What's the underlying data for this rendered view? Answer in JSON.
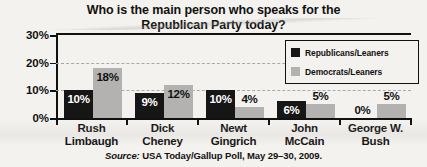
{
  "chart_data": {
    "type": "bar",
    "title": "Who is the main person who speaks for the Republican Party today?",
    "title_line1": "Who is the main person who speaks for the",
    "title_line2": "Republican Party today?",
    "xlabel": "",
    "ylabel": "",
    "ylim": [
      0,
      30
    ],
    "ytick_labels": [
      "0%",
      "10%",
      "20%",
      "30%"
    ],
    "ytick_values": [
      0,
      10,
      20,
      30
    ],
    "grid": "horizontal-dashed",
    "legend_position": "top-right-inside",
    "categories": [
      "Rush Limbaugh",
      "Dick Cheney",
      "Newt Gingrich",
      "John McCain",
      "George W. Bush"
    ],
    "category_lines": [
      [
        "Rush",
        "Limbaugh"
      ],
      [
        "Dick",
        "Cheney"
      ],
      [
        "Newt",
        "Gingrich"
      ],
      [
        "John",
        "McCain"
      ],
      [
        "George W.",
        "Bush"
      ]
    ],
    "series": [
      {
        "name": "Republicans/Leaners",
        "color": "#161616",
        "values": [
          10,
          9,
          10,
          6,
          0
        ],
        "value_labels": [
          "10%",
          "9%",
          "10%",
          "6%",
          "0%"
        ]
      },
      {
        "name": "Democrats/Leaners",
        "color": "#b3b2b0",
        "values": [
          18,
          12,
          4,
          5,
          5
        ],
        "value_labels": [
          "18%",
          "12%",
          "4%",
          "5%",
          "5%"
        ]
      }
    ],
    "source_prefix": "Source:",
    "source_text": "USA Today/Gallup Poll, May 29–30, 2009."
  },
  "legend": {
    "items": [
      {
        "label": "Republicans/Leaners",
        "color": "#161616"
      },
      {
        "label": "Democrats/Leaners",
        "color": "#b3b2b0"
      }
    ]
  },
  "colors": {
    "background": "#f4f2ee",
    "axis": "#111111",
    "grid": "#a9a9a9",
    "republican": "#161616",
    "democrat": "#b3b2b0"
  }
}
